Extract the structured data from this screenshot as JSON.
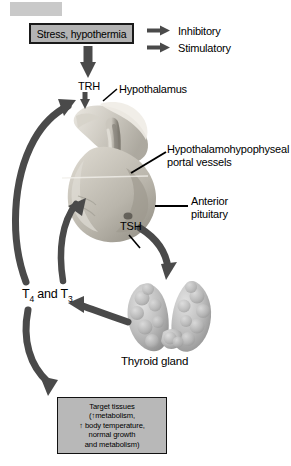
{
  "figure": {
    "background_color": "#ffffff"
  },
  "colors": {
    "arrow_dark": "#4a4a4a",
    "arrow_black": "#3a3a3a",
    "box_fill": "#b3b3b3",
    "box_border": "#1a1a1a",
    "gland_light": "#d8d4cb",
    "gland_mid": "#b9b5ab",
    "gland_dark": "#8e8a80",
    "thyroid_fill": "#bdbdbd",
    "leader_line": "#000000"
  },
  "stimulus_box": {
    "label": "Stress, hypothermia"
  },
  "legend": {
    "items": [
      {
        "icon": "arrow-right-icon",
        "label": "Inhibitory"
      },
      {
        "icon": "arrow-right-icon",
        "label": "Stimulatory"
      }
    ]
  },
  "labels": {
    "trh": "TRH",
    "hypothalamus": "Hypothalamus",
    "portal_vessels_line1": "Hypothalamohypophyseal",
    "portal_vessels_line2": "portal vessels",
    "anterior_line1": "Anterior",
    "anterior_line2": "pituitary",
    "tsh": "TSH",
    "t4_t3_prefix": "T",
    "t4_sub": "4",
    "t4_t3_mid": " and T",
    "t3_sub": "3",
    "thyroid_gland": "Thyroid gland"
  },
  "target_box": {
    "line1": "Target tissues",
    "line2_arrow": "↑",
    "line2_text": "(↑metabolism,",
    "line3": "↑ body temperature,",
    "line4": "normal growth",
    "line5": "and metabolism)"
  },
  "arrows": {
    "stress_to_trh": "down-arrow-stress-to-trh",
    "trh_to_pituitary": "down-arrow-trh-to-pituitary",
    "tsh_to_thyroid": "curved-arrow-tsh-to-thyroid",
    "thyroid_to_t4t3": "curved-arrow-thyroid-to-t4t3",
    "t4t3_to_hypothalamus": "curved-feedback-arrow-to-hypothalamus",
    "t4t3_to_pituitary": "curved-feedback-arrow-to-pituitary",
    "t4t3_to_target": "curved-arrow-to-target-tissues"
  }
}
